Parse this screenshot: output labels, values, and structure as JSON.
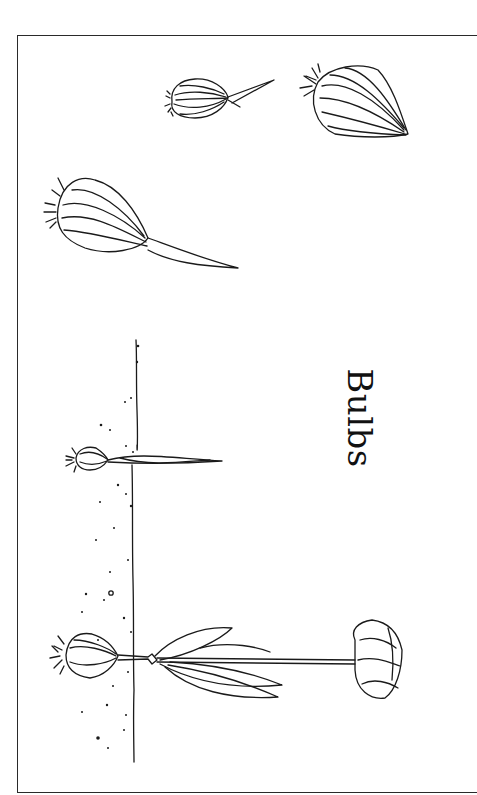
{
  "title": "Bulbs",
  "illustrations": [
    {
      "name": "sprouting-bulb-small",
      "description": "small onion-like bulb with a sprout"
    },
    {
      "name": "dormant-bulb-large",
      "description": "large teardrop-shaped bulb with roots"
    },
    {
      "name": "sprouting-bulb-long-shoot",
      "description": "bulb with a long pointed shoot"
    },
    {
      "name": "planted-bulb-seedling",
      "description": "young bulb with shoot breaking through soil line"
    },
    {
      "name": "flowering-tulip",
      "description": "mature tulip with bulb, leaves and flower"
    }
  ],
  "colors": {
    "ink": "#1a1a1a",
    "paper": "#ffffff"
  }
}
